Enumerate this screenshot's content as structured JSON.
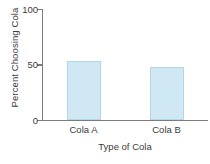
{
  "chart_data": {
    "type": "bar",
    "title": "",
    "categories": [
      "Cola A",
      "Cola B"
    ],
    "values": [
      53,
      48
    ],
    "xlabel": "Type of Cola",
    "ylabel": "Percent Choosing Cola",
    "ylim": [
      0,
      100
    ],
    "yticks": [
      0,
      50,
      100
    ],
    "ytick_labels": [
      "0",
      "50",
      "100"
    ],
    "grid": false,
    "legend": null,
    "bar_color": "#cfe8f3",
    "bar_edge_color": "#b2d7e8",
    "axis_color": "#7c7c7c",
    "text_color": "#3b3b3b",
    "background": "#ffffff"
  }
}
